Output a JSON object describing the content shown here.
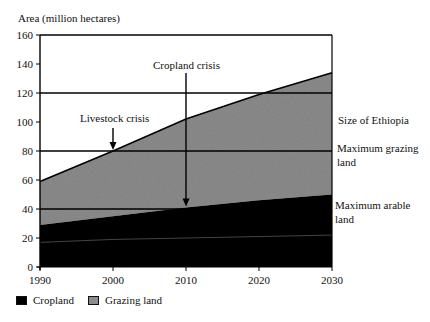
{
  "chart_data": {
    "type": "area",
    "stacked": true,
    "title": "",
    "ylabel": "Area (million hectares)",
    "xlabel": "",
    "x": [
      1990,
      2000,
      2010,
      2020,
      2030
    ],
    "series": [
      {
        "name": "Cropland",
        "values": [
          29,
          35,
          41,
          46,
          50
        ],
        "color": "#000000"
      },
      {
        "name": "Grazing land",
        "values": [
          30,
          45,
          61,
          73,
          84
        ],
        "color": "#8c8c8c"
      }
    ],
    "totals": [
      59,
      80,
      102,
      119,
      134
    ],
    "inner_line": {
      "values": [
        17,
        19,
        20,
        21,
        22
      ],
      "color": "#555555"
    },
    "xlim": [
      1990,
      2030
    ],
    "ylim": [
      0,
      160
    ],
    "xticks": [
      "1990",
      "2000",
      "2010",
      "2020",
      "2030"
    ],
    "yticks": [
      "0",
      "20",
      "40",
      "60",
      "80",
      "100",
      "120",
      "140",
      "160"
    ],
    "reference_lines": [
      {
        "y": 120,
        "label": "Size of Ethiopia"
      },
      {
        "y": 80,
        "label_line1": "Maximum grazing",
        "label_line2": "land"
      },
      {
        "y": 40,
        "label_line1": "Maximum arable",
        "label_line2": "land"
      }
    ],
    "annotations": [
      {
        "text": "Livestock crisis",
        "x": 2000,
        "arrow_to_y": 80
      },
      {
        "text": "Cropland crisis",
        "x": 2010,
        "arrow_to_y": 41
      }
    ],
    "legend": {
      "position": "bottom-left",
      "entries": [
        "Cropland",
        "Grazing land"
      ]
    },
    "grid": false
  },
  "labels": {
    "ylabel": "Area (million hectares)",
    "size_of_ethiopia": "Size of Ethiopia",
    "max_grazing_1": "Maximum grazing",
    "max_grazing_2": "land",
    "max_arable_1": "Maximum arable",
    "max_arable_2": "land",
    "livestock_crisis": "Livestock crisis",
    "cropland_crisis": "Cropland crisis",
    "legend_cropland": "Cropland",
    "legend_grazing": "Grazing land"
  }
}
